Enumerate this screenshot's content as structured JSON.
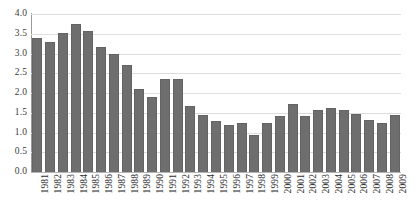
{
  "chart_data": {
    "type": "bar",
    "title": "",
    "subtitle": "",
    "xlabel": "",
    "ylabel": "",
    "xlim_categories": [
      "1981",
      "2009"
    ],
    "ylim": [
      0.0,
      4.0
    ],
    "ytick_step": 0.5,
    "grid": "horizontal",
    "legend": "none",
    "bar_color": "#6e6e6e",
    "gridline_color": "#dddddd",
    "axis_color": "#9a9a9a",
    "background": "#ffffff",
    "categories": [
      "1981",
      "1982",
      "1983",
      "1984",
      "1985",
      "1986",
      "1987",
      "1988",
      "1989",
      "1990",
      "1991",
      "1992",
      "1993",
      "1994",
      "1995",
      "1996",
      "1997",
      "1998",
      "1999",
      "2000",
      "2001",
      "2002",
      "2003",
      "2004",
      "2005",
      "2006",
      "2007",
      "2008",
      "2009"
    ],
    "values": [
      3.4,
      3.3,
      3.52,
      3.75,
      3.58,
      3.17,
      3.0,
      2.72,
      2.1,
      1.9,
      2.35,
      2.35,
      1.66,
      1.44,
      1.3,
      1.2,
      1.24,
      0.93,
      1.25,
      1.42,
      1.72,
      1.43,
      1.58,
      1.62,
      1.56,
      1.48,
      1.31,
      1.23,
      1.44
    ],
    "ytick_labels": [
      "0.0",
      "0.5",
      "1.0",
      "1.5",
      "2.0",
      "2.5",
      "3.0",
      "3.5",
      "4.0"
    ],
    "ytick_values": [
      0.0,
      0.5,
      1.0,
      1.5,
      2.0,
      2.5,
      3.0,
      3.5,
      4.0
    ]
  }
}
